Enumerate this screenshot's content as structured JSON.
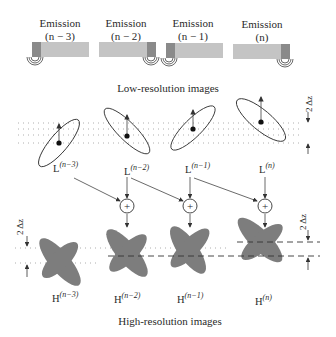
{
  "emissions": [
    {
      "title": "Emission",
      "index": "(n − 3)",
      "emitter_side": "left"
    },
    {
      "title": "Emission",
      "index": "(n − 2)",
      "emitter_side": "right"
    },
    {
      "title": "Emission",
      "index": "(n − 1)",
      "emitter_side": "left"
    },
    {
      "title": "Emission",
      "index": "(n)",
      "emitter_side": "right"
    }
  ],
  "low_res_caption": "Low-resolution images",
  "high_res_caption": "High-resolution images",
  "low_res": [
    {
      "base": "L",
      "sup": "(n−3)"
    },
    {
      "base": "L",
      "sup": "(n−2)"
    },
    {
      "base": "L",
      "sup": "(n−1)"
    },
    {
      "base": "L",
      "sup": "(n)"
    }
  ],
  "high_res": [
    {
      "base": "H",
      "sup": "(n−3)"
    },
    {
      "base": "H",
      "sup": "(n−2)"
    },
    {
      "base": "H",
      "sup": "(n−1)"
    },
    {
      "base": "H",
      "sup": "(n)"
    }
  ],
  "sum_symbol": "+",
  "displacement_label": "2 Δz",
  "colors": {
    "bar_light": "#c4c4c4",
    "bar_dark": "#8a8a8a",
    "blob": "#7d7d7d",
    "line": "#333333"
  }
}
